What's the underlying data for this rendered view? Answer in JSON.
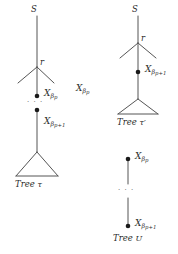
{
  "figure": {
    "stroke_color": "#4a4a4a",
    "node_color": "#1a1a1a",
    "text_color": "#2b2b2b",
    "background": "#ffffff"
  },
  "tree_tau": {
    "root_label": "S",
    "branch_label": "r",
    "node_upper": {
      "base": "X",
      "sub": "β",
      "subsub": "p"
    },
    "node_lower": {
      "base": "X",
      "sub": "β",
      "subsub": "p+1"
    },
    "ellipsis": "· · ·",
    "caption_word": "Tree",
    "caption_symbol": "τ"
  },
  "floating_label": {
    "base": "X",
    "sub": "β",
    "subsub": "p"
  },
  "tree_tau_prime": {
    "root_label": "S",
    "branch_label": "r",
    "node_label": {
      "base": "X",
      "sub": "β",
      "subsub": "p+1"
    },
    "caption_word": "Tree",
    "caption_symbol": "τ′"
  },
  "tree_u": {
    "node_upper": {
      "base": "X",
      "sub": "β",
      "subsub": "p"
    },
    "node_lower": {
      "base": "X",
      "sub": "β",
      "subsub": "p+1"
    },
    "ellipsis": "· · ·",
    "caption_word": "Tree",
    "caption_symbol": "U"
  }
}
